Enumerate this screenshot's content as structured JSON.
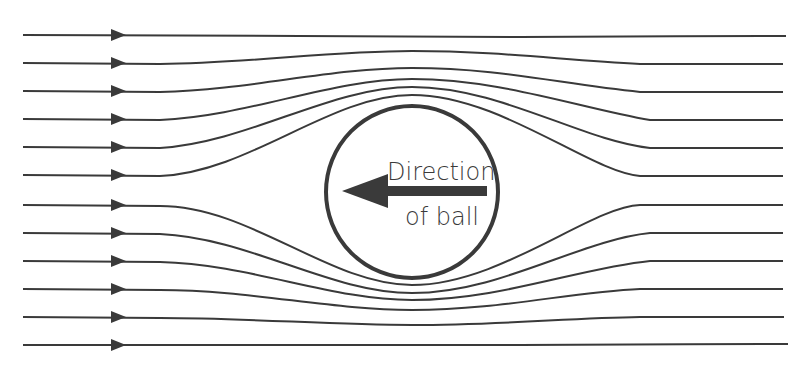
{
  "diagram": {
    "colors": {
      "background": "#ffffff",
      "stroke": "#3a3a3a"
    },
    "ball": {
      "label_line1": "Direction",
      "label_line2": "of ball",
      "arrow_direction": "left"
    },
    "streamlines": {
      "count": 12,
      "flow_direction": "right",
      "arrowhead_x": 118
    }
  }
}
